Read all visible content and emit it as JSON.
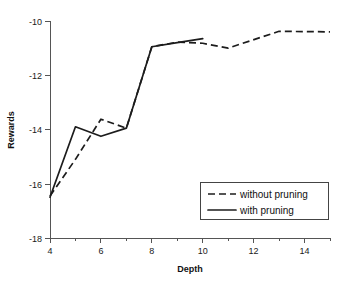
{
  "chart_data": {
    "type": "line",
    "title": "",
    "xlabel": "Depth",
    "ylabel": "Rewards",
    "xlim": [
      4,
      15
    ],
    "ylim": [
      -18,
      -10
    ],
    "grid": false,
    "legend_position": "lower-right",
    "x_ticks": [
      4,
      6,
      8,
      10,
      12,
      14
    ],
    "x_tick_labels": [
      "4",
      "6",
      "8",
      "10",
      "12",
      "14"
    ],
    "x_minor_ticks": [
      5,
      7,
      9,
      11,
      13,
      15
    ],
    "y_ticks": [
      -10,
      -12,
      -14,
      -16,
      -18
    ],
    "y_tick_labels": [
      "-10",
      "-12",
      "-14",
      "-16",
      "-18"
    ],
    "series": [
      {
        "name": "without pruning",
        "style": "dashed",
        "color": "#1c1c1c",
        "x": [
          4,
          5,
          6,
          7,
          8,
          9,
          10
        ],
        "values": [
          -16.5,
          -13.9,
          -14.25,
          -13.95,
          -10.95,
          -10.8,
          -10.65
        ]
      },
      {
        "name": "with pruning",
        "style": "solid",
        "color": "#1c1c1c",
        "x": [
          4,
          5,
          6,
          7,
          8,
          9,
          10,
          11,
          13,
          15
        ],
        "values": [
          -16.45,
          -15.1,
          -13.62,
          -13.95,
          -10.95,
          -10.78,
          -10.82,
          -11.0,
          -10.38,
          -10.4
        ]
      }
    ]
  },
  "legend": {
    "entries": [
      {
        "label": "without pruning",
        "style": "dashed"
      },
      {
        "label": "with pruning",
        "style": "solid"
      }
    ]
  },
  "axes": {
    "x_title": "Depth",
    "y_title": "Rewards"
  }
}
